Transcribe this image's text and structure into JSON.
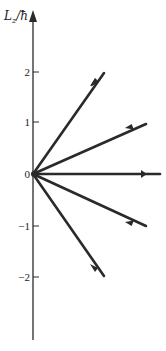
{
  "diagram": {
    "type": "vector-model",
    "title": "",
    "axis_label": "L_z/ħ",
    "axis_label_main": "L",
    "axis_label_sub": "z",
    "axis_label_suffix": "/ħ",
    "ticks": [
      {
        "value": 2,
        "label": "2"
      },
      {
        "value": 1,
        "label": "1"
      },
      {
        "value": 0,
        "label": "0"
      },
      {
        "value": -1,
        "label": "−1"
      },
      {
        "value": -2,
        "label": "−2"
      }
    ],
    "vectors": [
      {
        "m": 2,
        "description": "angular momentum vector with L_z = 2ħ"
      },
      {
        "m": 1,
        "description": "angular momentum vector with L_z = 1ħ"
      },
      {
        "m": 0,
        "description": "angular momentum vector with L_z = 0"
      },
      {
        "m": -1,
        "description": "angular momentum vector with L_z = −1ħ"
      },
      {
        "m": -2,
        "description": "angular momentum vector with L_z = −2ħ"
      }
    ],
    "colors": {
      "line": "#2a2a2a",
      "background": "#ffffff"
    }
  }
}
